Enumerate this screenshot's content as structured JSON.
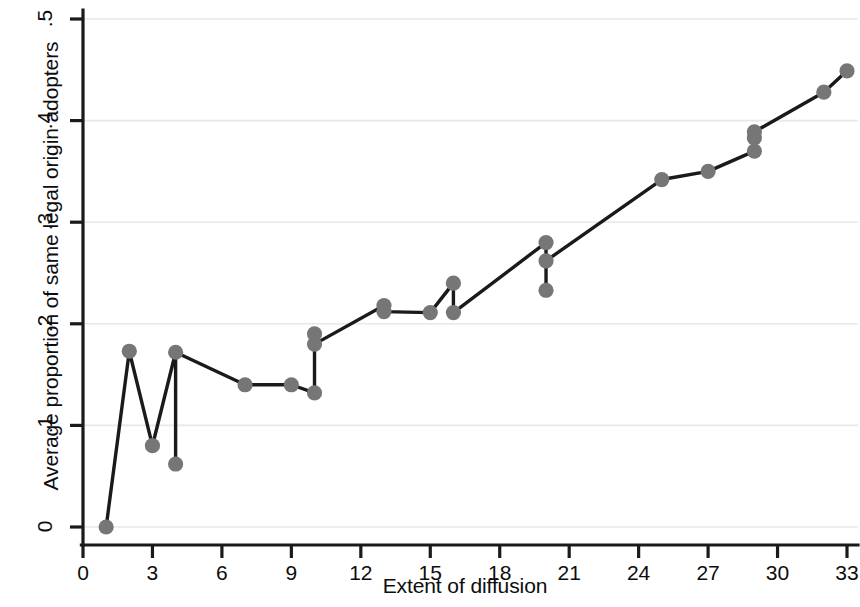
{
  "chart_data": {
    "type": "line",
    "title": "",
    "subtitle": "",
    "xlabel": "Extent of diffusion",
    "ylabel": "Average proportion of same legal origin adopters",
    "xlim": [
      0,
      33.6
    ],
    "ylim": [
      0,
      0.5
    ],
    "xticks": [
      0,
      3,
      6,
      9,
      12,
      15,
      18,
      21,
      24,
      27,
      30,
      33
    ],
    "xtick_labels": [
      "0",
      "3",
      "6",
      "9",
      "12",
      "15",
      "18",
      "21",
      "24",
      "27",
      "30",
      "33"
    ],
    "yticks": [
      0,
      0.1,
      0.2,
      0.3,
      0.4,
      0.5
    ],
    "ytick_labels": [
      "0",
      ".1",
      ".2",
      ".3",
      ".4",
      ".5"
    ],
    "grid": "horizontal",
    "legend": "none",
    "annotations": [],
    "marker": "circle",
    "marker_color": "#767676",
    "line_color": "#1a1a1a",
    "axis_color": "#1a1a1a",
    "grid_color": "#e8e8e8",
    "background_color": "#ffffff",
    "series": [
      {
        "name": "Average proportion of same legal origin adopters",
        "points": [
          {
            "x": 1,
            "y": 0.0
          },
          {
            "x": 2,
            "y": 0.173
          },
          {
            "x": 3,
            "y": 0.08
          },
          {
            "x": 4,
            "y": 0.172
          },
          {
            "x": 4,
            "y": 0.062
          },
          {
            "x": 7,
            "y": 0.14
          },
          {
            "x": 9,
            "y": 0.14
          },
          {
            "x": 10,
            "y": 0.19
          },
          {
            "x": 10,
            "y": 0.18
          },
          {
            "x": 10,
            "y": 0.132
          },
          {
            "x": 13,
            "y": 0.218
          },
          {
            "x": 13,
            "y": 0.212
          },
          {
            "x": 15,
            "y": 0.211
          },
          {
            "x": 16,
            "y": 0.24
          },
          {
            "x": 16,
            "y": 0.211
          },
          {
            "x": 20,
            "y": 0.28
          },
          {
            "x": 20,
            "y": 0.262
          },
          {
            "x": 20,
            "y": 0.233
          },
          {
            "x": 25,
            "y": 0.342
          },
          {
            "x": 27,
            "y": 0.35
          },
          {
            "x": 29,
            "y": 0.389
          },
          {
            "x": 29,
            "y": 0.383
          },
          {
            "x": 29,
            "y": 0.37
          },
          {
            "x": 32,
            "y": 0.428
          },
          {
            "x": 33,
            "y": 0.449
          }
        ],
        "path": [
          {
            "x": 1,
            "y": 0.0
          },
          {
            "x": 2,
            "y": 0.173
          },
          {
            "x": 3,
            "y": 0.08
          },
          {
            "x": 4,
            "y": 0.172
          },
          {
            "x": 4,
            "y": 0.062
          },
          {
            "x": 4,
            "y": 0.172
          },
          {
            "x": 7,
            "y": 0.14
          },
          {
            "x": 9,
            "y": 0.14
          },
          {
            "x": 10,
            "y": 0.132
          },
          {
            "x": 10,
            "y": 0.19
          },
          {
            "x": 10,
            "y": 0.18
          },
          {
            "x": 13,
            "y": 0.218
          },
          {
            "x": 13,
            "y": 0.212
          },
          {
            "x": 15,
            "y": 0.211
          },
          {
            "x": 16,
            "y": 0.24
          },
          {
            "x": 16,
            "y": 0.211
          },
          {
            "x": 20,
            "y": 0.28
          },
          {
            "x": 20,
            "y": 0.233
          },
          {
            "x": 20,
            "y": 0.262
          },
          {
            "x": 25,
            "y": 0.342
          },
          {
            "x": 27,
            "y": 0.35
          },
          {
            "x": 29,
            "y": 0.37
          },
          {
            "x": 29,
            "y": 0.389
          },
          {
            "x": 32,
            "y": 0.428
          },
          {
            "x": 33,
            "y": 0.449
          }
        ]
      }
    ]
  }
}
